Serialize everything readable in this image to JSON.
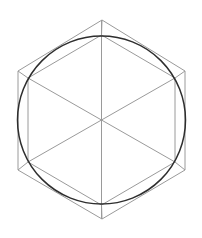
{
  "diagram": {
    "type": "geometric-construction",
    "canvas": {
      "width": 202,
      "height": 238,
      "background": "#ffffff"
    },
    "colors": {
      "thin_line": "#9a9a9a",
      "circle": "#2e2e2e"
    },
    "center": [
      101.5,
      120
    ],
    "circle": {
      "cx": 101.5,
      "cy": 120,
      "r": 84
    },
    "outer_hexagon": [
      [
        102,
        20
      ],
      [
        185,
        71
      ],
      [
        185,
        170
      ],
      [
        102,
        219
      ],
      [
        18,
        170
      ],
      [
        18,
        71
      ]
    ],
    "inner_hexagon": [
      [
        101.5,
        35
      ],
      [
        175,
        78
      ],
      [
        175,
        162
      ],
      [
        101.5,
        205
      ],
      [
        28,
        162
      ],
      [
        28,
        78
      ]
    ],
    "diameters": [
      [
        [
          101.5,
          20
        ],
        [
          101.5,
          219
        ]
      ],
      [
        [
          28,
          78
        ],
        [
          175,
          162
        ]
      ],
      [
        [
          175,
          78
        ],
        [
          28,
          162
        ]
      ]
    ]
  }
}
